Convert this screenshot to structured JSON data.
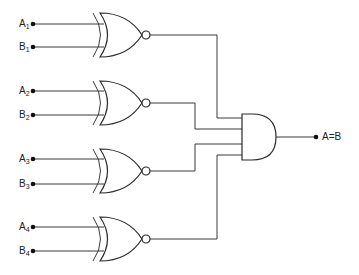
{
  "diagram": {
    "type": "4-bit equality comparator",
    "inputs": [
      {
        "letter": "A",
        "sub": "1"
      },
      {
        "letter": "B",
        "sub": "1"
      },
      {
        "letter": "A",
        "sub": "2"
      },
      {
        "letter": "B",
        "sub": "2"
      },
      {
        "letter": "A",
        "sub": "3"
      },
      {
        "letter": "B",
        "sub": "3"
      },
      {
        "letter": "A",
        "sub": "4"
      },
      {
        "letter": "B",
        "sub": "4"
      }
    ],
    "gates": [
      {
        "name": "xnor-gate-1",
        "kind": "XNOR"
      },
      {
        "name": "xnor-gate-2",
        "kind": "XNOR"
      },
      {
        "name": "xnor-gate-3",
        "kind": "XNOR"
      },
      {
        "name": "xnor-gate-4",
        "kind": "XNOR"
      },
      {
        "name": "and-gate",
        "kind": "AND",
        "inputs": 4
      }
    ],
    "output": {
      "label": "A=B"
    },
    "colors": {
      "line": "#3a3a3a",
      "background": "#ffffff"
    }
  }
}
